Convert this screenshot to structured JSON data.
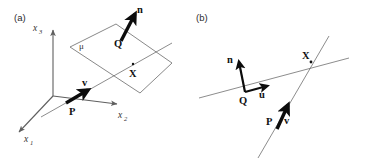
{
  "figure": {
    "panels": [
      {
        "id": "panel-a",
        "label": "(a)",
        "description": "Ray-plane intersection in 3D coordinate frame",
        "axes": [
          {
            "name": "x3",
            "base": "x",
            "sub": "3"
          },
          {
            "name": "x2",
            "base": "x",
            "sub": "2"
          },
          {
            "name": "x1",
            "base": "x",
            "sub": "1"
          }
        ],
        "points": [
          {
            "name": "P",
            "label": "P"
          },
          {
            "name": "Q",
            "label": "Q"
          },
          {
            "name": "X",
            "label": "X"
          }
        ],
        "vectors": [
          {
            "name": "v",
            "label": "v"
          },
          {
            "name": "n",
            "label": "n"
          }
        ],
        "surfaces": [
          {
            "name": "plane-mu",
            "label": "μ"
          }
        ]
      },
      {
        "id": "panel-b",
        "label": "(b)",
        "description": "Two intersecting lines with direction vectors",
        "points": [
          {
            "name": "Q",
            "label": "Q"
          },
          {
            "name": "P",
            "label": "P"
          },
          {
            "name": "X",
            "label": "X"
          }
        ],
        "vectors": [
          {
            "name": "n",
            "label": "n"
          },
          {
            "name": "u",
            "label": "u"
          },
          {
            "name": "v",
            "label": "v"
          }
        ]
      }
    ],
    "colors": {
      "background": "#ffffff",
      "thin_line": "#6e6e6e",
      "plane_edge": "#7a7a7a",
      "axis_line": "#5f5f5f",
      "vector": "#0c0c0c",
      "text": "#111111"
    }
  }
}
